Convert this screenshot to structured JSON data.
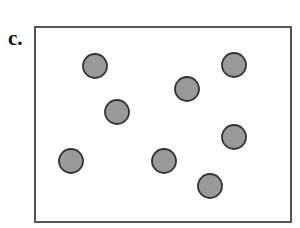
{
  "panel": {
    "label": "c.",
    "frame": {
      "x": 35,
      "y": 27,
      "width": 256,
      "height": 195,
      "stroke": "#555555"
    },
    "dot_style": {
      "radius": 12,
      "fill": "#999999",
      "stroke": "#333333"
    },
    "dots": [
      {
        "cx": 95,
        "cy": 66
      },
      {
        "cx": 117,
        "cy": 112
      },
      {
        "cx": 187,
        "cy": 89
      },
      {
        "cx": 234,
        "cy": 65
      },
      {
        "cx": 71,
        "cy": 161
      },
      {
        "cx": 164,
        "cy": 161
      },
      {
        "cx": 234,
        "cy": 137
      },
      {
        "cx": 210,
        "cy": 186
      }
    ]
  }
}
